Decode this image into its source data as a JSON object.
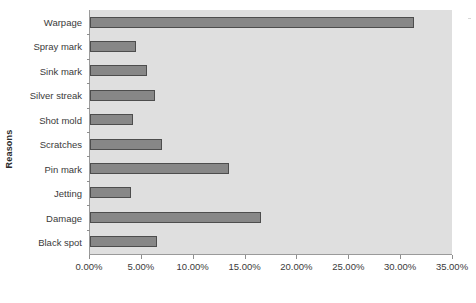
{
  "chart_data": {
    "type": "bar",
    "orientation": "horizontal",
    "title": "",
    "xlabel": "",
    "ylabel": "Reasons",
    "categories": [
      "Warpage",
      "Spray mark",
      "Sink mark",
      "Silver streak",
      "Shot mold",
      "Scratches",
      "Pin mark",
      "Jetting",
      "Damage",
      "Black spot"
    ],
    "values": [
      31.3,
      4.4,
      5.5,
      6.3,
      4.2,
      7.0,
      13.4,
      4.0,
      16.5,
      6.5
    ],
    "value_unit": "%",
    "xlim": [
      0,
      35
    ],
    "xtick_values": [
      0,
      5,
      10,
      15,
      20,
      25,
      30,
      35
    ],
    "xtick_labels": [
      "0.00%",
      "5.00%",
      "10.00%",
      "15.00%",
      "20.00%",
      "25.00%",
      "30.00%",
      "35.00%"
    ],
    "grid": false,
    "legend": null,
    "colors": {
      "bar_fill": "#878787",
      "bar_border": "#4d4d4d",
      "plot_background": "#dfdfdf",
      "axis_line": "#9a9a9a",
      "text": "#3a3a3a",
      "page_background": "#ffffff"
    }
  }
}
